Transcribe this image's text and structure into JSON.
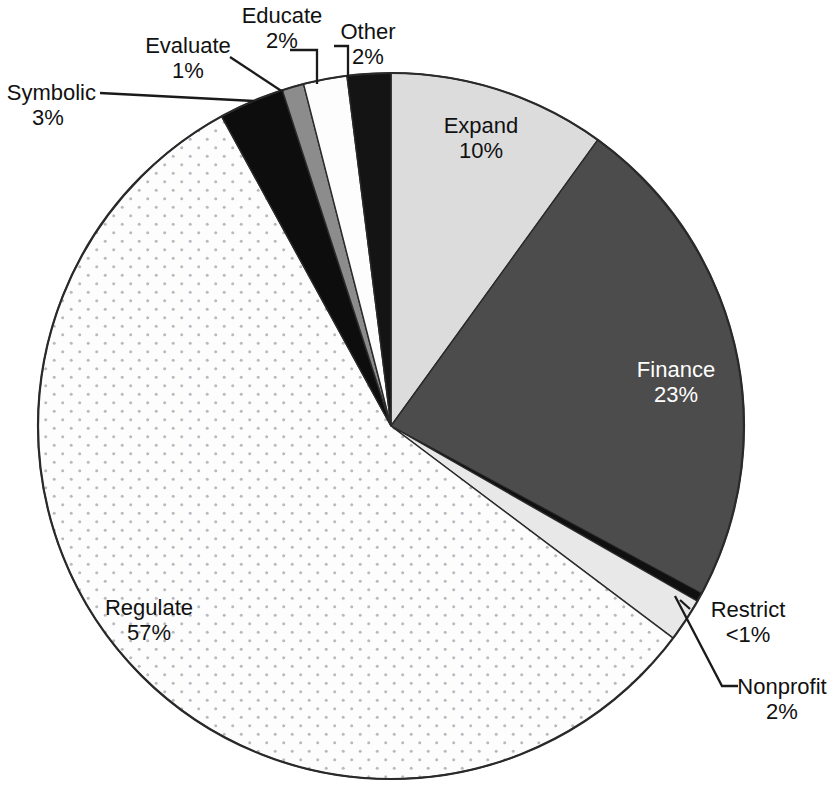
{
  "chart_data": {
    "type": "pie",
    "title": "",
    "subtitle": "",
    "xlabel": "",
    "ylabel": "",
    "legend_position": "callout-labels",
    "grid": false,
    "start_angle_deg": 0,
    "direction": "clockwise",
    "categories": [
      "Expand",
      "Finance",
      "Restrict",
      "Nonprofit",
      "Regulate",
      "Symbolic",
      "Evaluate",
      "Educate",
      "Other"
    ],
    "values": [
      10,
      23,
      0.4,
      2,
      57,
      3,
      1,
      2,
      2
    ],
    "value_labels": [
      "10%",
      "23%",
      "<1%",
      "2%",
      "57%",
      "3%",
      "1%",
      "2%",
      "2%"
    ],
    "slice_fills": [
      "#dcdcdc",
      "#4c4c4c",
      "#101010",
      "#e8e8e8",
      "#fdfdfd",
      "#0d0d0d",
      "#8c8c8c",
      "#fdfdfd",
      "#141414"
    ],
    "slice_patterns": [
      "solid",
      "solid",
      "solid",
      "solid",
      "dotted",
      "solid",
      "solid",
      "solid",
      "solid"
    ],
    "slices": [
      {
        "name": "Expand",
        "value": 10,
        "label": "Expand",
        "pct": "10%",
        "fill": "#dcdcdc",
        "pattern": "solid",
        "label_placement": "inside"
      },
      {
        "name": "Finance",
        "value": 23,
        "label": "Finance",
        "pct": "23%",
        "fill": "#4c4c4c",
        "pattern": "solid",
        "label_placement": "inside-light"
      },
      {
        "name": "Restrict",
        "value": 0.4,
        "label": "Restrict",
        "pct": "<1%",
        "fill": "#101010",
        "pattern": "solid",
        "label_placement": "callout"
      },
      {
        "name": "Nonprofit",
        "value": 2,
        "label": "Nonprofit",
        "pct": "2%",
        "fill": "#e8e8e8",
        "pattern": "solid",
        "label_placement": "callout"
      },
      {
        "name": "Regulate",
        "value": 57,
        "label": "Regulate",
        "pct": "57%",
        "fill": "#fdfdfd",
        "pattern": "dotted",
        "label_placement": "inside"
      },
      {
        "name": "Symbolic",
        "value": 3,
        "label": "Symbolic",
        "pct": "3%",
        "fill": "#0d0d0d",
        "pattern": "solid",
        "label_placement": "callout"
      },
      {
        "name": "Evaluate",
        "value": 1,
        "label": "Evaluate",
        "pct": "1%",
        "fill": "#8c8c8c",
        "pattern": "solid",
        "label_placement": "callout"
      },
      {
        "name": "Educate",
        "value": 2,
        "label": "Educate",
        "pct": "2%",
        "fill": "#fdfdfd",
        "pattern": "solid",
        "label_placement": "callout"
      },
      {
        "name": "Other",
        "value": 2,
        "label": "Other",
        "pct": "2%",
        "fill": "#141414",
        "pattern": "solid",
        "label_placement": "callout"
      }
    ],
    "geometry": {
      "cx": 391,
      "cy": 426,
      "r": 353,
      "outline_color": "#2a2a2a",
      "outline_width": 2.2
    }
  },
  "labels": {
    "expand": {
      "name": "Expand",
      "pct": "10%"
    },
    "finance": {
      "name": "Finance",
      "pct": "23%"
    },
    "restrict": {
      "name": "Restrict",
      "pct": "<1%"
    },
    "nonprofit": {
      "name": "Nonprofit",
      "pct": "2%"
    },
    "regulate": {
      "name": "Regulate",
      "pct": "57%"
    },
    "symbolic": {
      "name": "Symbolic",
      "pct": "3%"
    },
    "evaluate": {
      "name": "Evaluate",
      "pct": "1%"
    },
    "educate": {
      "name": "Educate",
      "pct": "2%"
    },
    "other": {
      "name": "Other",
      "pct": "2%"
    }
  },
  "colors": {
    "background": "#ffffff",
    "text": "#111111",
    "text_on_dark": "#ffffff",
    "outline": "#2a2a2a",
    "leader_line": "#1a1a1a",
    "stipple_dot": "#b9b9c4"
  }
}
